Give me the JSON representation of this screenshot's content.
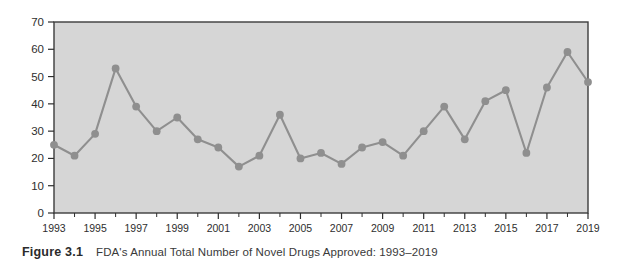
{
  "figure": {
    "caption_label": "Figure 3.1",
    "caption_text": "FDA's Annual Total Number of Novel Drugs Approved: 1993–2019"
  },
  "style": {
    "plot_background": "#d6d6d6",
    "plot_border": "#3c3c3c",
    "series_color": "#8f8f8f",
    "tick_color": "#2e2e2e",
    "page_background": "#ffffff"
  },
  "chart_data": {
    "type": "line",
    "title": "FDA's Annual Total Number of Novel Drugs Approved: 1993–2019",
    "xlabel": "",
    "ylabel": "",
    "grid": false,
    "legend": "none",
    "markers": true,
    "xlim": [
      1993,
      2019
    ],
    "ylim": [
      0,
      70
    ],
    "ytick_labels": [
      "0",
      "10",
      "20",
      "30",
      "40",
      "50",
      "60",
      "70"
    ],
    "yticks": [
      0,
      10,
      20,
      30,
      40,
      50,
      60,
      70
    ],
    "xtick_labels": [
      "1993",
      "1995",
      "1997",
      "1999",
      "2001",
      "2003",
      "2005",
      "2007",
      "2009",
      "2011",
      "2013",
      "2015",
      "2017",
      "2019"
    ],
    "xticks": [
      1993,
      1995,
      1997,
      1999,
      2001,
      2003,
      2005,
      2007,
      2009,
      2011,
      2013,
      2015,
      2017,
      2019
    ],
    "x": [
      1993,
      1994,
      1995,
      1996,
      1997,
      1998,
      1999,
      2000,
      2001,
      2002,
      2003,
      2004,
      2005,
      2006,
      2007,
      2008,
      2009,
      2010,
      2011,
      2012,
      2013,
      2014,
      2015,
      2016,
      2017,
      2018,
      2019
    ],
    "values": [
      25,
      21,
      29,
      53,
      39,
      30,
      35,
      27,
      24,
      17,
      21,
      36,
      20,
      22,
      18,
      24,
      26,
      21,
      30,
      39,
      27,
      41,
      45,
      22,
      46,
      59,
      48
    ],
    "series": [
      {
        "name": "Novel drugs approved",
        "values": [
          25,
          21,
          29,
          53,
          39,
          30,
          35,
          27,
          24,
          17,
          21,
          36,
          20,
          22,
          18,
          24,
          26,
          21,
          30,
          39,
          27,
          41,
          45,
          22,
          46,
          59,
          48
        ]
      }
    ]
  }
}
